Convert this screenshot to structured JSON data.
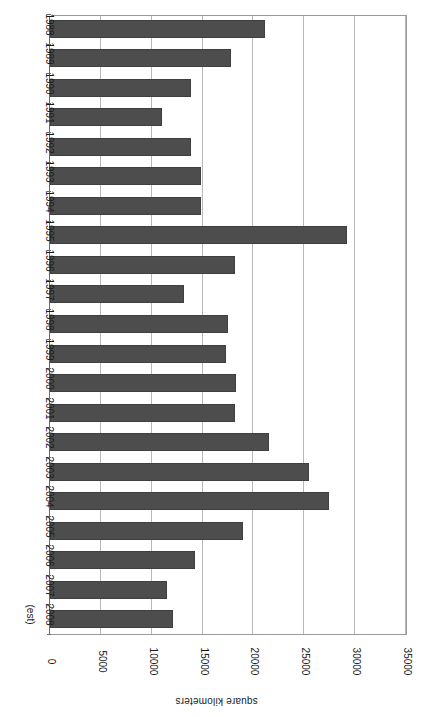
{
  "chart_data": {
    "type": "bar",
    "orientation": "horizontal-rotated-180",
    "title": "",
    "subtitle": "",
    "xlabel": "square kilometers",
    "ylabel": "",
    "grid": true,
    "legend": null,
    "value_axis": {
      "label": "square kilometers",
      "min": 0,
      "max": 35000,
      "tick_step": 5000,
      "ticks": [
        0,
        5000,
        10000,
        15000,
        20000,
        25000,
        30000,
        35000
      ],
      "tick_labels": [
        "0",
        "5000",
        "10000",
        "15000",
        "20000",
        "25000",
        "30000",
        "35000"
      ]
    },
    "category_axis": {
      "label": "",
      "note": "(est)",
      "note_applies_to": "2008"
    },
    "categories": [
      "1988",
      "1989",
      "1990",
      "1991",
      "1992",
      "1993",
      "1994",
      "1995",
      "1996",
      "1997",
      "1998",
      "1999",
      "2000",
      "2001",
      "2002",
      "2003",
      "2004",
      "2005",
      "2006",
      "2007",
      "2008"
    ],
    "values": [
      21150,
      17800,
      13900,
      11000,
      13900,
      14850,
      14850,
      29200,
      18200,
      13200,
      17500,
      17300,
      18300,
      18200,
      21550,
      25500,
      27450,
      19000,
      14300,
      11500,
      12100
    ],
    "series": [
      {
        "name": "square kilometers",
        "color": "#4d4d4d",
        "values": [
          21150,
          17800,
          13900,
          11000,
          13900,
          14850,
          14850,
          29200,
          18200,
          13200,
          17500,
          17300,
          18300,
          18200,
          21550,
          25500,
          27450,
          19000,
          14300,
          11500,
          12100
        ]
      }
    ]
  },
  "style": {
    "bar_fill": "#4d4d4d",
    "bar_stroke": "#3f3f3f",
    "gridline_color": "#b8b8b8",
    "axis_color": "#6a6a6a",
    "text_color": "#1a1a1a",
    "background": "#ffffff"
  }
}
